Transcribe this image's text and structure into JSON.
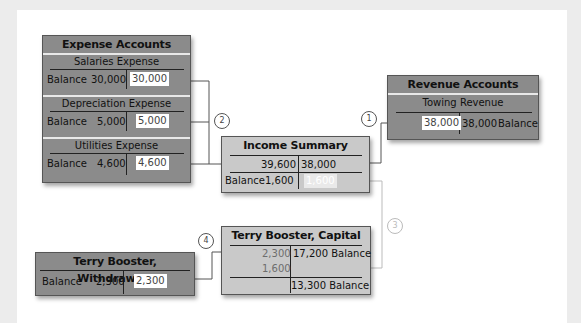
{
  "expense_accounts": {
    "title": "Expense Accounts",
    "accounts": [
      {
        "name": "Salaries Expense",
        "balance_label": "Balance",
        "debit": "30,000",
        "credit": "30,000"
      },
      {
        "name": "Depreciation Expense",
        "balance_label": "Balance",
        "debit": "5,000",
        "credit": "5,000"
      },
      {
        "name": "Utilities Expense",
        "balance_label": "Balance",
        "debit": "4,600",
        "credit": "4,600"
      }
    ]
  },
  "revenue_accounts": {
    "title": "Revenue Accounts",
    "account": {
      "name": "Towing Revenue",
      "debit": "38,000",
      "credit": "38,000",
      "balance_label": "Balance"
    }
  },
  "income_summary": {
    "title": "Income Summary",
    "debit": "39,600",
    "credit": "38,000",
    "balance_label": "Balance",
    "balance_value": "1,600",
    "closing_credit": "1,600"
  },
  "capital": {
    "title": "Terry Booster, Capital",
    "debit_1": "2,300",
    "debit_2": "1,600",
    "credit_1": "17,200 Balance",
    "ending": "13,300 Balance"
  },
  "withdrawals": {
    "title": "Terry Booster, Withdrawals",
    "balance_label": "Balance",
    "debit": "2,300",
    "credit": "2,300"
  },
  "steps": [
    "1",
    "2",
    "3",
    "4"
  ],
  "colors": {
    "dark_box": "#8b8b8b",
    "light_box": "#c9c9c9",
    "line": "#555555",
    "faint_line": "#bbbbbb"
  }
}
